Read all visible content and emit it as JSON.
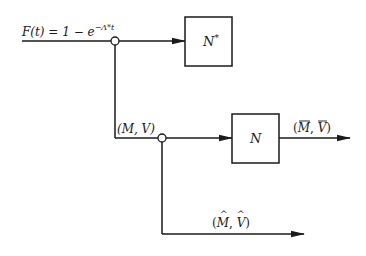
{
  "diagram": {
    "input_label": "F(t) = 1 − e",
    "input_exponent": "−Λ*t",
    "blocks": [
      {
        "id": "n_star",
        "label": "N",
        "superscript": "*"
      },
      {
        "id": "n",
        "label": "N"
      }
    ],
    "signals": {
      "branch_mv": "(M, V)",
      "output_bar_m": "M",
      "output_bar_v": "V",
      "output_hat_m": "M",
      "output_hat_v": "V"
    },
    "colors": {
      "stroke": "#1a1a1a",
      "background": "#ffffff"
    }
  }
}
